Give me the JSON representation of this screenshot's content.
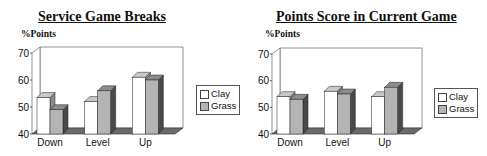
{
  "chart_data": [
    {
      "type": "bar",
      "title": "Service Game Breaks",
      "ylabel": "%Points",
      "xlabel": "",
      "categories": [
        "Down",
        "Level",
        "Up"
      ],
      "series": [
        {
          "name": "Clay",
          "values": [
            53.5,
            52,
            61
          ]
        },
        {
          "name": "Grass",
          "values": [
            49,
            56,
            60
          ]
        }
      ],
      "ylim": [
        40,
        70
      ],
      "yticks": [
        40,
        50,
        60,
        70
      ],
      "grid": false,
      "legend_position": "right",
      "style": "3d-column"
    },
    {
      "type": "bar",
      "title": "Points Score in Current Game",
      "ylabel": "%Points",
      "xlabel": "",
      "categories": [
        "Down",
        "Level",
        "Up"
      ],
      "series": [
        {
          "name": "Clay",
          "values": [
            54,
            56,
            54
          ]
        },
        {
          "name": "Grass",
          "values": [
            53,
            55,
            57.5
          ]
        }
      ],
      "ylim": [
        40,
        70
      ],
      "yticks": [
        40,
        50,
        60,
        70
      ],
      "grid": false,
      "legend_position": "right",
      "style": "3d-column"
    }
  ],
  "colors": {
    "clay_front": "#ffffff",
    "clay_top": "#c8c8c8",
    "clay_side": "#8a8a8a",
    "grass_front": "#b4b4b4",
    "grass_top": "#8c8c8c",
    "grass_side": "#4a4a4a",
    "floor": "#6a6a6a"
  }
}
